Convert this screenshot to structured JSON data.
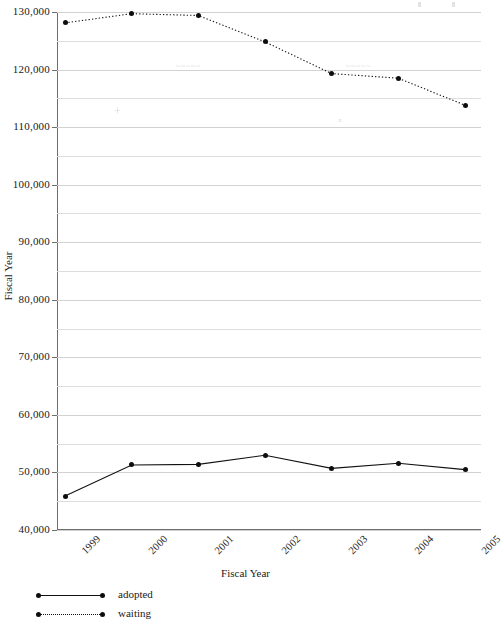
{
  "chart_data": {
    "type": "line",
    "title": "",
    "xlabel": "Fiscal Year",
    "ylabel": "Fiscal Year",
    "categories": [
      "1999",
      "2000",
      "2001",
      "2002",
      "2003",
      "2004",
      "2005"
    ],
    "ylim": [
      40000,
      130000
    ],
    "ytick_labels": [
      "130,000",
      "120,000",
      "110,000",
      "100,000",
      "90,000",
      "80,000",
      "70,000",
      "60,000",
      "50,000",
      "40,000"
    ],
    "ytick_values": [
      130000,
      120000,
      110000,
      100000,
      90000,
      80000,
      70000,
      60000,
      50000,
      40000
    ],
    "yticks_minor_step": 5000,
    "grid": true,
    "legend_position": "bottom-left",
    "series": [
      {
        "name": "adopted",
        "style": "solid",
        "marker": "circle",
        "color": "#111111",
        "values": [
          45900,
          51300,
          51400,
          53000,
          50700,
          51600,
          50500
        ]
      },
      {
        "name": "waiting",
        "style": "dotted",
        "marker": "circle",
        "color": "#111111",
        "values": [
          128100,
          129700,
          129400,
          124800,
          119300,
          118500,
          113800
        ]
      }
    ]
  },
  "legend": {
    "items": [
      {
        "label": "adopted",
        "style": "solid"
      },
      {
        "label": "waiting",
        "style": "dotted"
      }
    ]
  },
  "axes": {
    "x_title": "Fiscal Year",
    "y_title": "Fiscal Year"
  },
  "artifacts": {
    "smudges": [
      {
        "text": "scan artifact",
        "x": 176,
        "y": 62
      },
      {
        "text": "scan artifact",
        "x": 346,
        "y": 62
      },
      {
        "text": "x",
        "x": 338,
        "y": 118
      },
      {
        "text": "+",
        "x": 114,
        "y": 108
      }
    ]
  }
}
